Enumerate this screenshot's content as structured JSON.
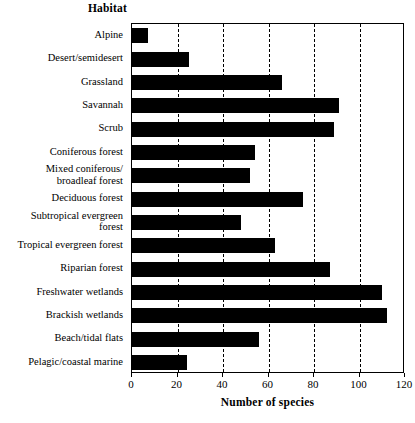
{
  "chart_data": {
    "type": "bar",
    "orientation": "horizontal",
    "title": "",
    "xlabel": "Number of species",
    "ylabel": "Habitat",
    "categories": [
      "Alpine",
      "Desert/semidesert",
      "Grassland",
      "Savannah",
      "Scrub",
      "Coniferous forest",
      "Mixed coniferous/ broadleaf forest",
      "Deciduous forest",
      "Subtropical evergreen forest",
      "Tropical evergreen forest",
      "Riparian forest",
      "Freshwater wetlands",
      "Brackish wetlands",
      "Beach/tidal flats",
      "Pelagic/coastal marine"
    ],
    "category_lines": [
      [
        "Alpine"
      ],
      [
        "Desert/semidesert"
      ],
      [
        "Grassland"
      ],
      [
        "Savannah"
      ],
      [
        "Scrub"
      ],
      [
        "Coniferous forest"
      ],
      [
        "Mixed coniferous/",
        "broadleaf forest"
      ],
      [
        "Deciduous forest"
      ],
      [
        "Subtropical evergreen",
        "forest"
      ],
      [
        "Tropical evergreen forest"
      ],
      [
        "Riparian forest"
      ],
      [
        "Freshwater wetlands"
      ],
      [
        "Brackish wetlands"
      ],
      [
        "Beach/tidal flats"
      ],
      [
        "Pelagic/coastal marine"
      ]
    ],
    "values": [
      7,
      25,
      66,
      91,
      89,
      54,
      52,
      75,
      48,
      63,
      87,
      110,
      112,
      56,
      24
    ],
    "xlim": [
      0,
      120
    ],
    "xticks": [
      0,
      20,
      40,
      60,
      80,
      100,
      120
    ],
    "xtick_labels": [
      "0",
      "20",
      "40",
      "60",
      "80",
      "100",
      "120"
    ],
    "gridlines": [
      20,
      40,
      60,
      80,
      100
    ],
    "grid": true,
    "grid_style": "dashed",
    "legend": "none",
    "bar_color": "#000000",
    "background_color": "#FFFFFF",
    "axis_color": "#000000"
  }
}
